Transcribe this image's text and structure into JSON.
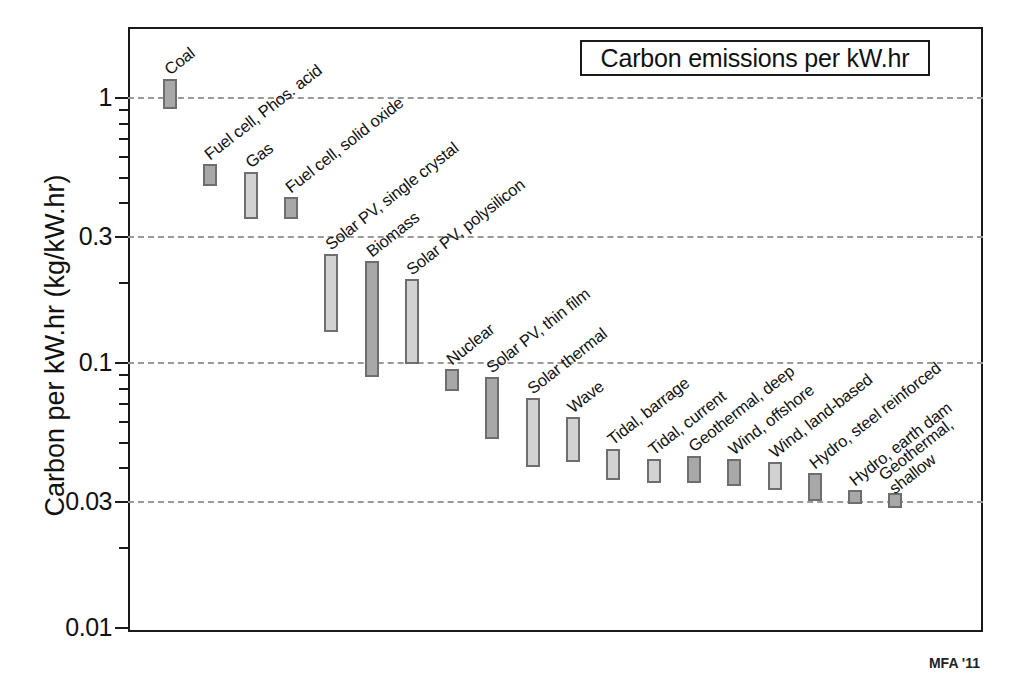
{
  "chart_data": {
    "type": "bar",
    "title": "Carbon emissions per kW.hr",
    "xlabel": "",
    "ylabel": "Carbon per kW.hr (kg/kW.hr)",
    "ylim": [
      0.01,
      2.0
    ],
    "yscale": "log",
    "ytick_labels": [
      "1",
      "0.3",
      "0.1",
      "0.03",
      "0.01"
    ],
    "ytick_values": [
      1,
      0.3,
      0.1,
      0.03,
      0.01
    ],
    "gridlines": [
      "1",
      "0.3",
      "0.1",
      "0.03"
    ],
    "grid": true,
    "legend": "none",
    "credit": "MFA '11",
    "value_units": "kg CO2 per kW.hr",
    "note": "Each bar is a range (low to high) of carbon emissions for that technology.",
    "categories": [
      {
        "label": "Coal",
        "low": 0.9,
        "high": 1.17
      },
      {
        "label": "Fuel cell, Phos. acid",
        "low": 0.46,
        "high": 0.56
      },
      {
        "label": "Gas",
        "low": 0.345,
        "high": 0.52
      },
      {
        "label": "Fuel cell, solid oxide",
        "low": 0.345,
        "high": 0.42
      },
      {
        "label": "Solar PV, single crystal",
        "low": 0.13,
        "high": 0.255
      },
      {
        "label": "Biomass",
        "low": 0.088,
        "high": 0.24
      },
      {
        "label": "Solar PV, polysilicon",
        "low": 0.098,
        "high": 0.205
      },
      {
        "label": "Nuclear",
        "low": 0.078,
        "high": 0.094
      },
      {
        "label": "Solar PV, thin film",
        "low": 0.051,
        "high": 0.088
      },
      {
        "label": "Solar thermal",
        "low": 0.04,
        "high": 0.073
      },
      {
        "label": "Wave",
        "low": 0.042,
        "high": 0.062
      },
      {
        "label": "Tidal, barrage",
        "low": 0.036,
        "high": 0.047
      },
      {
        "label": "Tidal, current",
        "low": 0.035,
        "high": 0.043
      },
      {
        "label": "Geothermal, deep",
        "low": 0.035,
        "high": 0.044
      },
      {
        "label": "Wind, offshore",
        "low": 0.034,
        "high": 0.043
      },
      {
        "label": "Wind, land-based",
        "low": 0.033,
        "high": 0.042
      },
      {
        "label": "Hydro, steel reinforced",
        "low": 0.03,
        "high": 0.038
      },
      {
        "label": "Hydro, earth dam",
        "low": 0.029,
        "high": 0.033
      },
      {
        "label": "Geothermal, shallow",
        "low": 0.028,
        "high": 0.032
      }
    ]
  },
  "colors": {
    "bar_fill_light": "#d2d2d2",
    "bar_fill_dark": "#a8a8a8",
    "bar_border": "#6e6e6e",
    "axis": "#1a1a1a",
    "grid": "#9a9a9a",
    "background": "#ffffff"
  }
}
